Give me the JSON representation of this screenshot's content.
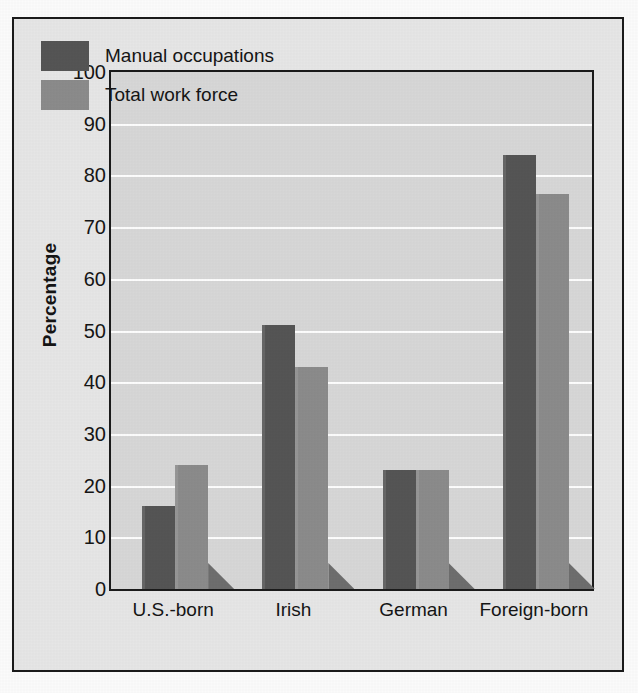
{
  "chart_data": {
    "type": "bar",
    "title": "",
    "xlabel": "",
    "ylabel": "Percentage",
    "ylim": [
      0,
      100
    ],
    "ytick_step": 10,
    "yticks": [
      100,
      90,
      80,
      70,
      60,
      50,
      40,
      30,
      20,
      10,
      0
    ],
    "grid": true,
    "legend_position": "top-left",
    "categories": [
      "U.S.-born",
      "Irish",
      "German",
      "Foreign-born"
    ],
    "series": [
      {
        "name": "Manual occupations",
        "color": "#555555",
        "values": [
          16,
          51,
          23,
          84
        ]
      },
      {
        "name": "Total work force",
        "color": "#8b8b8b",
        "values": [
          24,
          43,
          23,
          76.5
        ]
      }
    ]
  },
  "legend": {
    "items": [
      {
        "label": "Manual occupations",
        "swatch": "manual"
      },
      {
        "label": "Total work force",
        "swatch": "total"
      }
    ]
  },
  "axis": {
    "y_title": "Percentage"
  },
  "colors": {
    "manual": "#555555",
    "total": "#8b8b8b",
    "plot_background": "#d7d7d7",
    "figure_background": "#e6e6e6",
    "gridline": "#fdfdfd",
    "frame": "#1b1b1b"
  }
}
